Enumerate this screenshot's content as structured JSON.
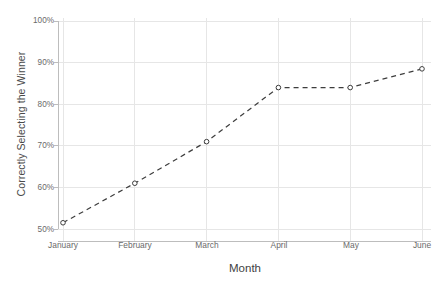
{
  "chart_data": {
    "type": "line",
    "title": "",
    "subtitle": "",
    "xlabel": "Month",
    "ylabel": "Correctly Selecting the Winner",
    "categories": [
      "January",
      "February",
      "March",
      "April",
      "May",
      "June"
    ],
    "values": [
      51.5,
      61,
      71,
      84,
      84,
      88.5
    ],
    "series": [
      {
        "name": "Correctly Selecting the Winner",
        "values": [
          51.5,
          61,
          71,
          84,
          84,
          88.5
        ]
      }
    ],
    "ylim": [
      50,
      100
    ],
    "yticks": [
      50,
      60,
      70,
      80,
      90,
      100
    ],
    "ytick_labels": [
      "50%",
      "60%",
      "70%",
      "80%",
      "90%",
      "100%"
    ],
    "xtick_labels": [
      "January",
      "February",
      "March",
      "April",
      "May",
      "June"
    ],
    "grid": true,
    "legend": "none",
    "line_style": "dashed",
    "marker": "open-circle",
    "line_color": "#3d3d3d",
    "grid_color": "#e6e6e6",
    "axis_color": "#bdbdbd",
    "background_color": "#ffffff"
  },
  "axes": {
    "y_title": "Correctly Selecting the Winner",
    "x_title": "Month"
  }
}
